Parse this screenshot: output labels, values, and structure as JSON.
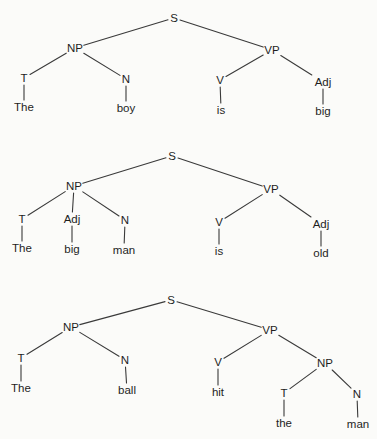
{
  "diagram": {
    "type": "syntax-trees",
    "background": "#fbfbf9",
    "line_color": "#3a3a3a",
    "text_color": "#1e1e1e",
    "trees": [
      {
        "id": "tree-1",
        "sentence": "The boy is big",
        "nodes": [
          {
            "id": "S",
            "label": "S",
            "x": 174,
            "y": 18,
            "kind": "category"
          },
          {
            "id": "NP",
            "label": "NP",
            "x": 75,
            "y": 48,
            "kind": "category"
          },
          {
            "id": "VP",
            "label": "VP",
            "x": 272,
            "y": 50,
            "kind": "category"
          },
          {
            "id": "T",
            "label": "T",
            "x": 24,
            "y": 78,
            "kind": "category"
          },
          {
            "id": "N",
            "label": "N",
            "x": 126,
            "y": 79,
            "kind": "category"
          },
          {
            "id": "V",
            "label": "V",
            "x": 220,
            "y": 80,
            "kind": "category"
          },
          {
            "id": "Adj",
            "label": "Adj",
            "x": 323,
            "y": 82,
            "kind": "category"
          },
          {
            "id": "w1",
            "label": "The",
            "x": 24,
            "y": 107,
            "kind": "word"
          },
          {
            "id": "w2",
            "label": "boy",
            "x": 126,
            "y": 108,
            "kind": "word"
          },
          {
            "id": "w3",
            "label": "is",
            "x": 221,
            "y": 110,
            "kind": "word"
          },
          {
            "id": "w4",
            "label": "big",
            "x": 323,
            "y": 111,
            "kind": "word"
          }
        ],
        "edges": [
          [
            "S",
            "NP"
          ],
          [
            "S",
            "VP"
          ],
          [
            "NP",
            "T"
          ],
          [
            "NP",
            "N"
          ],
          [
            "VP",
            "V"
          ],
          [
            "VP",
            "Adj"
          ],
          [
            "T",
            "w1"
          ],
          [
            "N",
            "w2"
          ],
          [
            "V",
            "w3"
          ],
          [
            "Adj",
            "w4"
          ]
        ]
      },
      {
        "id": "tree-2",
        "sentence": "The big man is old",
        "nodes": [
          {
            "id": "S",
            "label": "S",
            "x": 172,
            "y": 156,
            "kind": "category"
          },
          {
            "id": "NP",
            "label": "NP",
            "x": 74,
            "y": 186,
            "kind": "category"
          },
          {
            "id": "VP",
            "label": "VP",
            "x": 271,
            "y": 189,
            "kind": "category"
          },
          {
            "id": "T",
            "label": "T",
            "x": 22,
            "y": 219,
            "kind": "category"
          },
          {
            "id": "Adj1",
            "label": "Adj",
            "x": 72,
            "y": 219,
            "kind": "category"
          },
          {
            "id": "N",
            "label": "N",
            "x": 125,
            "y": 220,
            "kind": "category"
          },
          {
            "id": "V",
            "label": "V",
            "x": 219,
            "y": 222,
            "kind": "category"
          },
          {
            "id": "Adj2",
            "label": "Adj",
            "x": 321,
            "y": 224,
            "kind": "category"
          },
          {
            "id": "w1",
            "label": "The",
            "x": 22,
            "y": 248,
            "kind": "word"
          },
          {
            "id": "w2",
            "label": "big",
            "x": 72,
            "y": 249,
            "kind": "word"
          },
          {
            "id": "w3",
            "label": "man",
            "x": 124,
            "y": 250,
            "kind": "word"
          },
          {
            "id": "w4",
            "label": "is",
            "x": 219,
            "y": 251,
            "kind": "word"
          },
          {
            "id": "w5",
            "label": "old",
            "x": 321,
            "y": 253,
            "kind": "word"
          }
        ],
        "edges": [
          [
            "S",
            "NP"
          ],
          [
            "S",
            "VP"
          ],
          [
            "NP",
            "T"
          ],
          [
            "NP",
            "Adj1"
          ],
          [
            "NP",
            "N"
          ],
          [
            "VP",
            "V"
          ],
          [
            "VP",
            "Adj2"
          ],
          [
            "T",
            "w1"
          ],
          [
            "Adj1",
            "w2"
          ],
          [
            "N",
            "w3"
          ],
          [
            "V",
            "w4"
          ],
          [
            "Adj2",
            "w5"
          ]
        ]
      },
      {
        "id": "tree-3",
        "sentence": "The ball hit the man",
        "nodes": [
          {
            "id": "S",
            "label": "S",
            "x": 171,
            "y": 300,
            "kind": "category"
          },
          {
            "id": "NP",
            "label": "NP",
            "x": 71,
            "y": 327,
            "kind": "category"
          },
          {
            "id": "VP",
            "label": "VP",
            "x": 270,
            "y": 330,
            "kind": "category"
          },
          {
            "id": "T",
            "label": "T",
            "x": 21,
            "y": 358,
            "kind": "category"
          },
          {
            "id": "N",
            "label": "N",
            "x": 125,
            "y": 360,
            "kind": "category"
          },
          {
            "id": "V",
            "label": "V",
            "x": 218,
            "y": 362,
            "kind": "category"
          },
          {
            "id": "NP2",
            "label": "NP",
            "x": 325,
            "y": 363,
            "kind": "category"
          },
          {
            "id": "T2",
            "label": "T",
            "x": 284,
            "y": 393,
            "kind": "category"
          },
          {
            "id": "N2",
            "label": "N",
            "x": 357,
            "y": 394,
            "kind": "category"
          },
          {
            "id": "w1",
            "label": "The",
            "x": 21,
            "y": 388,
            "kind": "word"
          },
          {
            "id": "w2",
            "label": "ball",
            "x": 127,
            "y": 390,
            "kind": "word"
          },
          {
            "id": "w3",
            "label": "hit",
            "x": 218,
            "y": 392,
            "kind": "word"
          },
          {
            "id": "w4",
            "label": "the",
            "x": 284,
            "y": 423,
            "kind": "word"
          },
          {
            "id": "w5",
            "label": "man",
            "x": 358,
            "y": 424,
            "kind": "word"
          }
        ],
        "edges": [
          [
            "S",
            "NP"
          ],
          [
            "S",
            "VP"
          ],
          [
            "NP",
            "T"
          ],
          [
            "NP",
            "N"
          ],
          [
            "VP",
            "V"
          ],
          [
            "VP",
            "NP2"
          ],
          [
            "NP2",
            "T2"
          ],
          [
            "NP2",
            "N2"
          ],
          [
            "T",
            "w1"
          ],
          [
            "N",
            "w2"
          ],
          [
            "V",
            "w3"
          ],
          [
            "T2",
            "w4"
          ],
          [
            "N2",
            "w5"
          ]
        ]
      }
    ]
  }
}
